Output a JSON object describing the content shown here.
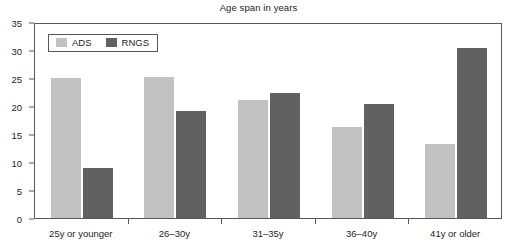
{
  "chart_data": {
    "type": "bar",
    "title": "Age span in years",
    "xlabel": "",
    "ylabel": "",
    "categories": [
      "25y or younger",
      "26–30y",
      "31–35y",
      "36–40y",
      "41y or older"
    ],
    "series": [
      {
        "name": "ADS",
        "color": "#c2c2c2",
        "values": [
          25.0,
          25.1,
          21.1,
          16.2,
          13.3
        ]
      },
      {
        "name": "RNGS",
        "color": "#616161",
        "values": [
          9.0,
          19.1,
          22.3,
          20.3,
          30.4
        ]
      }
    ],
    "ylim": [
      0,
      35
    ],
    "ytick_labels": [
      "0",
      "5",
      "10",
      "15",
      "20",
      "25",
      "30",
      "35"
    ],
    "ytick_values": [
      0,
      5,
      10,
      15,
      20,
      25,
      30,
      35
    ],
    "grid": false,
    "legend_position": "upper-left-inside",
    "frame": true
  },
  "axis": {
    "frame_color": "#585858"
  }
}
